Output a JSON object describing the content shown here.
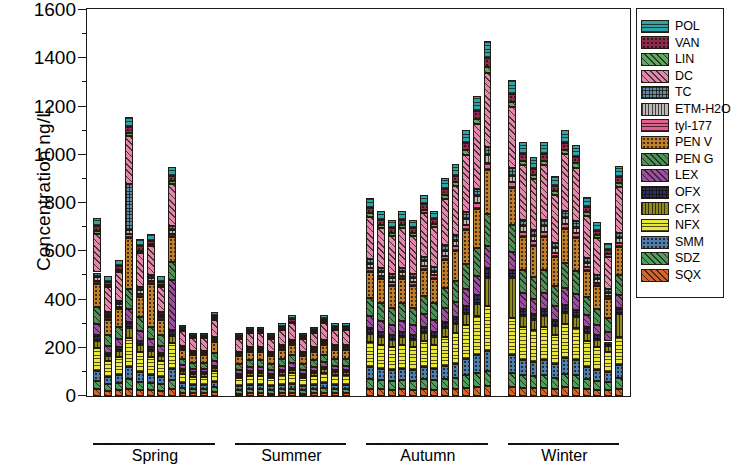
{
  "chart_data": {
    "type": "bar",
    "subtype": "stacked-bar-grouped",
    "title": "",
    "xlabel": "",
    "ylabel": "Concentration ng/L",
    "ylim": [
      0,
      1600
    ],
    "ytick_values": [
      0,
      200,
      400,
      600,
      800,
      1000,
      1200,
      1400,
      1600
    ],
    "ytick_labels": [
      "0",
      "200",
      "400",
      "600",
      "800",
      "1000",
      "1200",
      "1400",
      "1600"
    ],
    "yminor_values": [
      100,
      300,
      500,
      700,
      900,
      1100,
      1300,
      1500
    ],
    "grid": false,
    "legend_position": "right-outside",
    "series": [
      {
        "name": "POL",
        "color": "#2fa3a8",
        "pattern": "hlines"
      },
      {
        "name": "VAN",
        "color": "#8e2b4e",
        "pattern": "dots"
      },
      {
        "name": "LIN",
        "color": "#5fa85f",
        "pattern": "diag"
      },
      {
        "name": "DC",
        "color": "#e089ad",
        "pattern": "diag"
      },
      {
        "name": "TC",
        "color": "#5f8fa8",
        "pattern": "checker"
      },
      {
        "name": "ETM-H2O",
        "color": "#b9b9b9",
        "pattern": "vlines"
      },
      {
        "name": "tyl-177",
        "color": "#e2608f",
        "pattern": "hlines"
      },
      {
        "name": "PEN V",
        "color": "#c07f2a",
        "pattern": "dots"
      },
      {
        "name": "PEN G",
        "color": "#4f8f5a",
        "pattern": "diag"
      },
      {
        "name": "LEX",
        "color": "#9b4fa0",
        "pattern": "diag"
      },
      {
        "name": "OFX",
        "color": "#2c2f63",
        "pattern": "checker"
      },
      {
        "name": "CFX",
        "color": "#8d8a21",
        "pattern": "vlines"
      },
      {
        "name": "NFX",
        "color": "#e8e83a",
        "pattern": "hlines"
      },
      {
        "name": "SMM",
        "color": "#4e7fae",
        "pattern": "dots"
      },
      {
        "name": "SDZ",
        "color": "#4f9e5e",
        "pattern": "diag"
      },
      {
        "name": "SQX",
        "color": "#d4652c",
        "pattern": "diag"
      }
    ],
    "season_groups": [
      {
        "name": "Spring",
        "categories": [
          "3S1",
          "3S2",
          "3S3",
          "3S4",
          "4S1",
          "4S2",
          "4S3",
          "4S4",
          "5S1",
          "5S2",
          "5S3",
          "5S4"
        ]
      },
      {
        "name": "Summer",
        "categories": [
          "6S1",
          "6S2",
          "6S3",
          "6S4",
          "7S1",
          "7S2",
          "7S3",
          "8S1",
          "8S2",
          "8S3",
          "8S4"
        ]
      },
      {
        "name": "Autumn",
        "categories": [
          "9S1",
          "9S2",
          "9S3",
          "9S4",
          "10S1",
          "10S2",
          "10S3",
          "10S4",
          "11S1",
          "11S2",
          "11S3",
          "11S4"
        ]
      },
      {
        "name": "Winter",
        "categories": [
          "12S1",
          "12S2",
          "12S3",
          "12S4",
          "1S1",
          "1S2",
          "1S3",
          "2S1",
          "2S2",
          "2S3",
          "2S4"
        ]
      }
    ],
    "stack_order_bottom_to_top": [
      "SQX",
      "SDZ",
      "SMM",
      "NFX",
      "CFX",
      "OFX",
      "LEX",
      "PEN G",
      "PEN V",
      "tyl-177",
      "ETM-H2O",
      "TC",
      "DC",
      "LIN",
      "VAN",
      "POL"
    ],
    "values": {
      "SQX": [
        28,
        22,
        24,
        30,
        26,
        24,
        20,
        30,
        14,
        12,
        12,
        16,
        10,
        12,
        12,
        10,
        12,
        12,
        10,
        12,
        14,
        12,
        12,
        30,
        28,
        26,
        28,
        26,
        28,
        26,
        28,
        30,
        34,
        36,
        40,
        38,
        34,
        32,
        34,
        30,
        36,
        34,
        28,
        26,
        24,
        30
      ],
      "SDZ": [
        36,
        26,
        30,
        40,
        34,
        30,
        28,
        38,
        18,
        16,
        16,
        20,
        14,
        16,
        16,
        14,
        16,
        18,
        14,
        16,
        18,
        16,
        16,
        42,
        40,
        38,
        40,
        38,
        42,
        40,
        44,
        46,
        52,
        58,
        62,
        58,
        52,
        50,
        52,
        46,
        54,
        52,
        42,
        38,
        34,
        44
      ],
      "SMM": [
        40,
        30,
        34,
        52,
        38,
        34,
        30,
        46,
        20,
        18,
        18,
        22,
        16,
        18,
        18,
        16,
        18,
        20,
        16,
        18,
        20,
        18,
        18,
        48,
        46,
        44,
        46,
        44,
        50,
        46,
        54,
        58,
        66,
        74,
        84,
        72,
        64,
        60,
        64,
        56,
        66,
        62,
        50,
        44,
        40,
        54
      ],
      "NFX": [
        96,
        66,
        74,
        120,
        86,
        74,
        66,
        104,
        38,
        34,
        34,
        44,
        34,
        38,
        38,
        34,
        40,
        44,
        34,
        38,
        44,
        40,
        40,
        104,
        98,
        94,
        98,
        94,
        108,
        100,
        118,
        126,
        144,
        162,
        186,
        156,
        138,
        130,
        138,
        120,
        144,
        136,
        108,
        94,
        84,
        116
      ],
      "CFX": [
        30,
        20,
        24,
        38,
        26,
        24,
        20,
        32,
        12,
        10,
        10,
        14,
        10,
        12,
        12,
        10,
        12,
        14,
        10,
        12,
        14,
        12,
        12,
        34,
        32,
        30,
        32,
        30,
        34,
        32,
        38,
        40,
        46,
        52,
        118,
        164,
        44,
        42,
        44,
        38,
        46,
        44,
        34,
        30,
        26,
        96
      ],
      "OFX": [
        22,
        14,
        16,
        26,
        18,
        16,
        14,
        22,
        8,
        8,
        8,
        10,
        8,
        8,
        8,
        8,
        8,
        10,
        8,
        8,
        10,
        8,
        8,
        24,
        22,
        20,
        22,
        20,
        24,
        22,
        26,
        28,
        32,
        36,
        42,
        36,
        30,
        28,
        30,
        26,
        32,
        30,
        24,
        20,
        18,
        26
      ],
      "LEX": [
        46,
        30,
        34,
        54,
        40,
        34,
        30,
        210,
        18,
        16,
        16,
        20,
        16,
        18,
        18,
        16,
        18,
        20,
        16,
        18,
        20,
        18,
        18,
        50,
        46,
        44,
        46,
        44,
        52,
        48,
        56,
        60,
        68,
        78,
        88,
        74,
        64,
        60,
        64,
        56,
        68,
        64,
        50,
        44,
        38,
        54
      ],
      "PEN G": [
        70,
        46,
        52,
        84,
        60,
        52,
        46,
        74,
        26,
        24,
        24,
        32,
        24,
        26,
        26,
        24,
        28,
        30,
        24,
        26,
        30,
        28,
        28,
        76,
        72,
        68,
        72,
        68,
        78,
        72,
        84,
        90,
        104,
        118,
        134,
        112,
        98,
        92,
        98,
        86,
        104,
        98,
        76,
        66,
        58,
        82
      ],
      "PEN V": [
        96,
        62,
        72,
        210,
        84,
        178,
        62,
        102,
        36,
        32,
        32,
        44,
        34,
        36,
        36,
        34,
        38,
        42,
        34,
        36,
        42,
        38,
        38,
        106,
        100,
        94,
        100,
        94,
        108,
        100,
        116,
        124,
        142,
        162,
        184,
        154,
        136,
        128,
        136,
        118,
        142,
        134,
        106,
        92,
        80,
        114
      ],
      "tyl-177": [
        14,
        10,
        10,
        16,
        12,
        10,
        10,
        14,
        6,
        4,
        4,
        6,
        4,
        6,
        6,
        4,
        6,
        6,
        4,
        6,
        6,
        6,
        6,
        16,
        14,
        14,
        14,
        14,
        16,
        14,
        18,
        18,
        22,
        24,
        28,
        24,
        20,
        20,
        20,
        18,
        22,
        20,
        16,
        14,
        12,
        18
      ],
      "ETM-H2O": [
        16,
        10,
        12,
        18,
        14,
        12,
        10,
        16,
        6,
        6,
        6,
        8,
        6,
        6,
        6,
        6,
        6,
        8,
        6,
        6,
        8,
        6,
        6,
        18,
        16,
        16,
        16,
        16,
        18,
        16,
        20,
        22,
        24,
        28,
        32,
        26,
        24,
        22,
        24,
        20,
        24,
        24,
        18,
        16,
        14,
        20
      ],
      "TC": [
        18,
        12,
        12,
        192,
        14,
        12,
        12,
        18,
        6,
        6,
        6,
        8,
        6,
        6,
        6,
        6,
        8,
        8,
        6,
        6,
        8,
        8,
        8,
        20,
        18,
        18,
        18,
        18,
        20,
        18,
        22,
        24,
        28,
        30,
        34,
        30,
        26,
        24,
        26,
        22,
        28,
        26,
        20,
        18,
        16,
        22
      ],
      "DC": [
        160,
        104,
        120,
        196,
        140,
        120,
        104,
        172,
        60,
        54,
        54,
        72,
        56,
        60,
        60,
        56,
        64,
        70,
        56,
        60,
        70,
        64,
        64,
        176,
        166,
        158,
        166,
        158,
        180,
        166,
        194,
        206,
        238,
        270,
        306,
        256,
        226,
        212,
        226,
        196,
        236,
        222,
        176,
        152,
        134,
        190
      ],
      "LIN": [
        12,
        8,
        10,
        14,
        10,
        10,
        8,
        12,
        4,
        4,
        4,
        6,
        4,
        4,
        4,
        4,
        6,
        6,
        4,
        4,
        6,
        6,
        6,
        14,
        12,
        12,
        12,
        12,
        14,
        12,
        16,
        16,
        18,
        20,
        24,
        20,
        18,
        16,
        18,
        16,
        18,
        18,
        14,
        12,
        10,
        16
      ],
      "VAN": [
        20,
        14,
        14,
        24,
        18,
        14,
        14,
        20,
        8,
        6,
        6,
        10,
        6,
        8,
        8,
        6,
        8,
        10,
        6,
        8,
        10,
        8,
        8,
        22,
        20,
        20,
        20,
        20,
        22,
        20,
        24,
        26,
        30,
        34,
        38,
        32,
        28,
        26,
        28,
        24,
        30,
        28,
        22,
        20,
        16,
        26
      ],
      "POL": [
        36,
        24,
        26,
        44,
        32,
        26,
        24,
        38,
        14,
        12,
        12,
        16,
        12,
        14,
        14,
        12,
        16,
        16,
        12,
        14,
        16,
        14,
        14,
        40,
        36,
        34,
        36,
        34,
        40,
        36,
        44,
        46,
        54,
        60,
        70,
        58,
        50,
        48,
        50,
        42,
        54,
        50,
        40,
        34,
        30,
        44
      ]
    }
  },
  "legend": {
    "items": [
      "POL",
      "VAN",
      "LIN",
      "DC",
      "TC",
      "ETM-H2O",
      "tyl-177",
      "PEN V",
      "PEN G",
      "LEX",
      "OFX",
      "CFX",
      "NFX",
      "SMM",
      "SDZ",
      "SQX"
    ]
  },
  "axis": {
    "y_title": "Concentration ng/L"
  }
}
